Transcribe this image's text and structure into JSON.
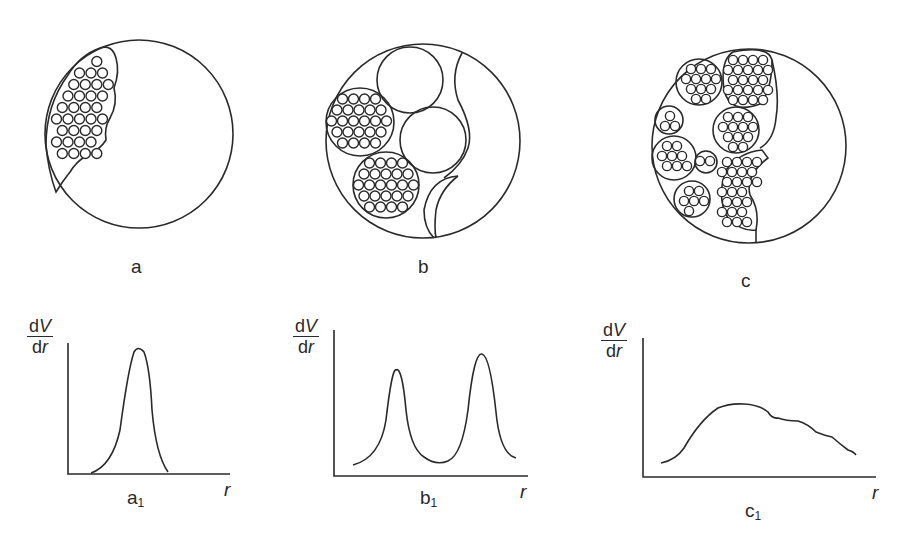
{
  "panels": {
    "a": {
      "label": "a"
    },
    "b": {
      "label": "b"
    },
    "c": {
      "label": "c"
    }
  },
  "charts_labels": {
    "a1": {
      "base": "a",
      "sub": "1"
    },
    "b1": {
      "base": "b",
      "sub": "1"
    },
    "c1": {
      "base": "c",
      "sub": "1"
    }
  },
  "axis": {
    "y_num_d": "d",
    "y_num_v": "V",
    "y_den_d": "d",
    "y_den_r": "r",
    "x_label": "r"
  },
  "chart_data": [
    {
      "type": "line",
      "title": "a1",
      "xlabel": "r",
      "ylabel": "dV/dr",
      "description": "Single narrow unimodal peak",
      "x": [
        0.0,
        0.1,
        0.2,
        0.3,
        0.35,
        0.4,
        0.45,
        0.5,
        0.55,
        0.6,
        0.7,
        0.8
      ],
      "values": [
        0.0,
        0.02,
        0.2,
        0.7,
        0.93,
        1.0,
        0.93,
        0.7,
        0.35,
        0.12,
        0.02,
        0.0
      ]
    },
    {
      "type": "line",
      "title": "b1",
      "xlabel": "r",
      "ylabel": "dV/dr",
      "description": "Bimodal distribution, second peak higher",
      "x": [
        0.0,
        0.15,
        0.25,
        0.3,
        0.35,
        0.45,
        0.55,
        0.65,
        0.75,
        0.8,
        0.85,
        0.95,
        1.0
      ],
      "values": [
        0.05,
        0.15,
        0.45,
        0.75,
        0.45,
        0.15,
        0.1,
        0.2,
        0.6,
        0.88,
        0.6,
        0.15,
        0.1
      ]
    },
    {
      "type": "line",
      "title": "c1",
      "xlabel": "r",
      "ylabel": "dV/dr",
      "description": "Broad distribution with irregular descending tail",
      "x": [
        0.0,
        0.1,
        0.2,
        0.3,
        0.4,
        0.5,
        0.6,
        0.7,
        0.8,
        0.9,
        1.0
      ],
      "values": [
        0.05,
        0.12,
        0.4,
        0.65,
        0.75,
        0.68,
        0.58,
        0.55,
        0.42,
        0.3,
        0.12
      ]
    }
  ]
}
